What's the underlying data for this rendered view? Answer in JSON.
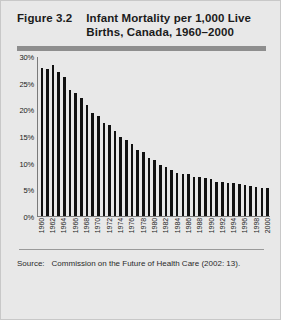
{
  "figure": {
    "number": "Figure 3.2",
    "title": "Infant Mortality per 1,000 Live Births, Canada, 1960–2000",
    "source_label": "Source:",
    "source_text": "Commission on the Future of Health Care (2002: 13)."
  },
  "style": {
    "background": "#e8e8e8",
    "bar_color": "#111111",
    "rule_color": "#8e8e8e",
    "axis_color": "#7a7a7a"
  },
  "chart_data": {
    "type": "bar",
    "title": "Infant Mortality per 1,000 Live Births, Canada, 1960–2000",
    "xlabel": "",
    "ylabel": "",
    "ylim": [
      0,
      30
    ],
    "ytick_labels": [
      "0%",
      "5%",
      "10%",
      "15%",
      "20%",
      "25%",
      "30%"
    ],
    "ytick_values": [
      0,
      5,
      10,
      15,
      20,
      25,
      30
    ],
    "grid": false,
    "legend": "none",
    "xtick_interval": 2,
    "categories": [
      "1960",
      "1961",
      "1962",
      "1963",
      "1964",
      "1965",
      "1966",
      "1967",
      "1968",
      "1969",
      "1970",
      "1971",
      "1972",
      "1973",
      "1974",
      "1975",
      "1976",
      "1977",
      "1978",
      "1979",
      "1980",
      "1981",
      "1982",
      "1983",
      "1984",
      "1985",
      "1986",
      "1987",
      "1988",
      "1989",
      "1990",
      "1991",
      "1992",
      "1993",
      "1994",
      "1995",
      "1996",
      "1997",
      "1998",
      "1999",
      "2000"
    ],
    "xtick_labels": [
      "1960",
      "1962",
      "1964",
      "1966",
      "1968",
      "1970",
      "1972",
      "1974",
      "1976",
      "1978",
      "1980",
      "1982",
      "1984",
      "1986",
      "1988",
      "1990",
      "1992",
      "1994",
      "1996",
      "1998",
      "2000"
    ],
    "values": [
      27.9,
      27.7,
      28.4,
      27.2,
      26.2,
      23.8,
      23.2,
      22.2,
      21.0,
      19.5,
      18.9,
      17.6,
      17.2,
      16.0,
      15.0,
      14.4,
      13.6,
      12.5,
      12.1,
      11.0,
      10.5,
      9.7,
      9.2,
      8.6,
      8.2,
      8.0,
      7.9,
      7.4,
      7.3,
      7.1,
      6.9,
      6.5,
      6.4,
      6.3,
      6.2,
      6.1,
      5.9,
      5.6,
      5.4,
      5.3,
      5.3
    ]
  }
}
